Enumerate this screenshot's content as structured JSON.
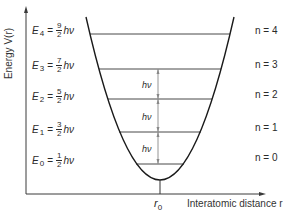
{
  "axes": {
    "y_label": "Energy V(r)",
    "x_label": "Interatomic distance r",
    "equilibrium_label": "r",
    "equilibrium_subscript": "0"
  },
  "levels": [
    {
      "symbol": "E",
      "sub": "4",
      "num": "9",
      "den": "2",
      "unit": "hν",
      "n_label": "n = 4",
      "n": 4
    },
    {
      "symbol": "E",
      "sub": "3",
      "num": "7",
      "den": "2",
      "unit": "hν",
      "n_label": "n = 3",
      "n": 3
    },
    {
      "symbol": "E",
      "sub": "2",
      "num": "5",
      "den": "2",
      "unit": "hν",
      "n_label": "n = 2",
      "n": 2
    },
    {
      "symbol": "E",
      "sub": "1",
      "num": "3",
      "den": "2",
      "unit": "hν",
      "n_label": "n = 1",
      "n": 1
    },
    {
      "symbol": "E",
      "sub": "0",
      "num": "1",
      "den": "2",
      "unit": "hν",
      "n_label": "n = 0",
      "n": 0
    }
  ],
  "spacing_labels": [
    "hν",
    "hν",
    "hν"
  ],
  "equals": "=",
  "colors": {
    "line": "#2a2a2a",
    "arrow": "#888888",
    "background": "#ffffff"
  }
}
